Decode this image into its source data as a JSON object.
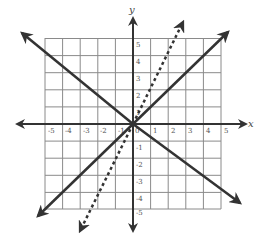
{
  "figure": {
    "type": "coordinate-plane",
    "axes": {
      "x_label": "x",
      "y_label": "y",
      "x_ticks": [
        "-5",
        "-4",
        "-3",
        "-2",
        "-1",
        "0",
        "1",
        "2",
        "3",
        "4",
        "5"
      ],
      "y_ticks_positive": [
        "1",
        "2",
        "3",
        "4",
        "5"
      ],
      "y_ticks_negative": [
        "-1",
        "-2",
        "-3",
        "-4",
        "-5"
      ],
      "x_range": [
        -5,
        5
      ],
      "y_range": [
        -5,
        5
      ]
    },
    "grid": {
      "shown": true,
      "step": 1,
      "color": "#888888"
    },
    "lines": [
      {
        "name": "line-y-equals-x",
        "equation": "y = x",
        "style": "solid",
        "color": "#333333"
      },
      {
        "name": "line-y-equals-neg-x",
        "equation": "y = -x",
        "style": "solid",
        "color": "#333333"
      },
      {
        "name": "line-y-equals-2x",
        "equation": "y = 2x",
        "style": "dashed",
        "color": "#333333"
      }
    ]
  }
}
